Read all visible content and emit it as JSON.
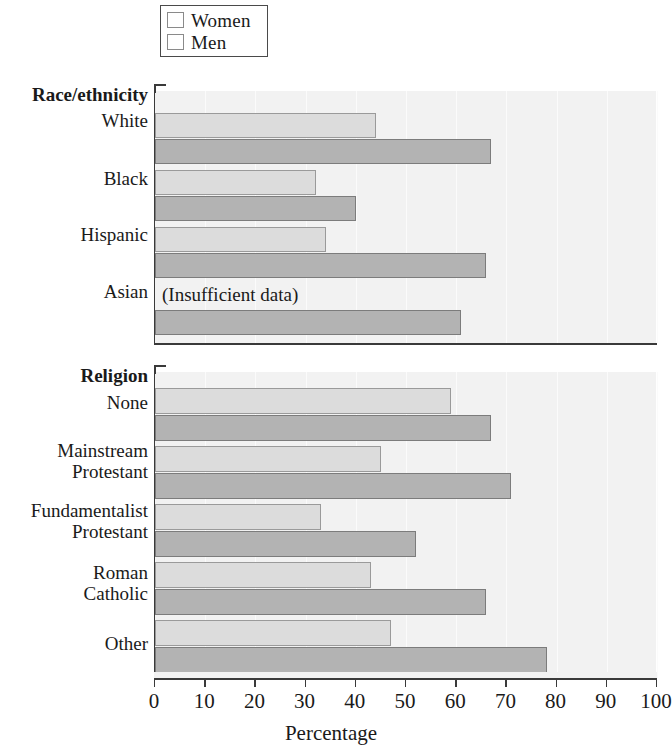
{
  "legend": {
    "items": [
      {
        "label": "Women",
        "color": "#dcdcdc"
      },
      {
        "label": "Men",
        "color": "#b3b3b3"
      }
    ]
  },
  "axis": {
    "title": "Percentage",
    "ticks": [
      "0",
      "10",
      "20",
      "30",
      "40",
      "50",
      "60",
      "70",
      "80",
      "90",
      "100"
    ]
  },
  "panels": [
    {
      "title": "Race/ethnicity",
      "categories": [
        "White",
        "Black",
        "Hispanic",
        "Asian"
      ],
      "note": "(Insufficient data)"
    },
    {
      "title": "Religion",
      "categories": [
        "None",
        "Mainstream\nProtestant",
        "Fundamentalist\nProtestant",
        "Roman\nCatholic",
        "Other"
      ]
    }
  ],
  "chart_data": {
    "type": "bar",
    "orientation": "horizontal",
    "title": "",
    "xlabel": "Percentage",
    "ylabel": "",
    "xlim": [
      0,
      100
    ],
    "xticks": [
      0,
      10,
      20,
      30,
      40,
      50,
      60,
      70,
      80,
      90,
      100
    ],
    "grid": true,
    "legend": [
      "Women",
      "Men"
    ],
    "legend_position": "top-left",
    "panels": [
      {
        "name": "Race/ethnicity",
        "categories": [
          "White",
          "Black",
          "Hispanic",
          "Asian"
        ],
        "series": [
          {
            "name": "Women",
            "values": [
              44,
              32,
              34,
              null
            ]
          },
          {
            "name": "Men",
            "values": [
              67,
              40,
              66,
              61
            ]
          }
        ],
        "annotations": [
          {
            "category": "Asian",
            "series": "Women",
            "text": "(Insufficient data)"
          }
        ]
      },
      {
        "name": "Religion",
        "categories": [
          "None",
          "Mainstream Protestant",
          "Fundamentalist Protestant",
          "Roman Catholic",
          "Other"
        ],
        "series": [
          {
            "name": "Women",
            "values": [
              59,
              45,
              33,
              43,
              47
            ]
          },
          {
            "name": "Men",
            "values": [
              67,
              71,
              52,
              66,
              78
            ]
          }
        ]
      }
    ]
  }
}
